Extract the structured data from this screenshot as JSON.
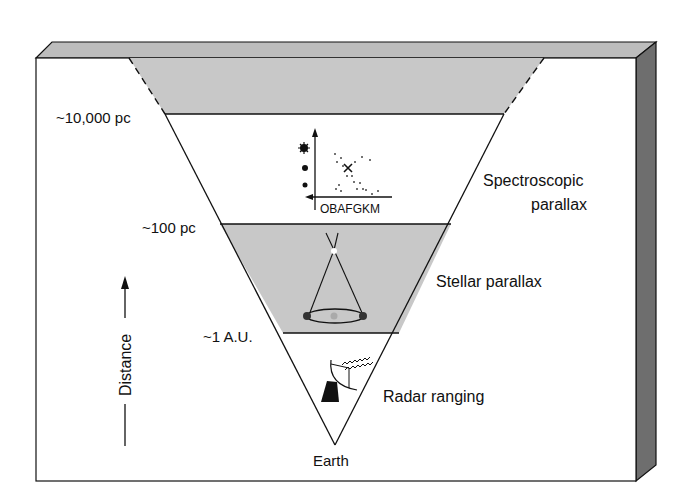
{
  "diagram": {
    "distance_axis_label": "Distance",
    "distance_markers": [
      {
        "label": "~10,000 pc"
      },
      {
        "label": "~100 pc"
      },
      {
        "label": "~1 A.U."
      }
    ],
    "methods": [
      {
        "label_line1": "Spectroscopic",
        "label_line2": "parallax"
      },
      {
        "label_line1": "Stellar parallax"
      },
      {
        "label_line1": "Radar ranging"
      }
    ],
    "origin_label": "Earth",
    "hr_diagram_axis_label": "OBAFGKM",
    "colors": {
      "band_gray": "#c8c8c8",
      "bevel_top": "#bdbdbd",
      "bevel_side": "#6e6e6e",
      "line": "#111111"
    }
  }
}
